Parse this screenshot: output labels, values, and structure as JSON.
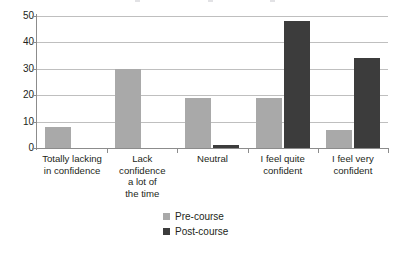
{
  "chart_data": {
    "type": "bar",
    "title": "",
    "xlabel": "",
    "ylabel": "",
    "ylim": [
      0,
      50
    ],
    "yticks": [
      0,
      10,
      20,
      30,
      40,
      50
    ],
    "grid": true,
    "legend_position": "bottom",
    "categories": [
      "Totally lacking in confidence",
      "Lack confidence a lot of the time",
      "Neutral",
      "I feel quite confident",
      "I feel very confident"
    ],
    "category_lines": [
      [
        "Totally lacking",
        "in confidence"
      ],
      [
        "Lack",
        "confidence",
        "a lot of",
        "the time"
      ],
      [
        "Neutral"
      ],
      [
        "I feel quite",
        "confident"
      ],
      [
        "I feel very",
        "confident"
      ]
    ],
    "series": [
      {
        "name": "Pre-course",
        "color": "#a9a9a9",
        "values": [
          8,
          30,
          19,
          19,
          7
        ]
      },
      {
        "name": "Post-course",
        "color": "#3c3c3c",
        "values": [
          0,
          0,
          1,
          48,
          34
        ]
      }
    ]
  },
  "axis": {
    "y_tick_labels": [
      "50",
      "40",
      "30",
      "20",
      "10",
      "0"
    ]
  },
  "legend": {
    "items": [
      {
        "label": "Pre-course",
        "swatch": "pre"
      },
      {
        "label": "Post-course",
        "swatch": "post"
      }
    ]
  }
}
